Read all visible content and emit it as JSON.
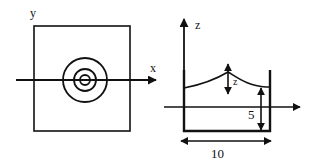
{
  "figure": {
    "background": "#ffffff",
    "ink": "#111111",
    "panels": [
      {
        "id": "top-view",
        "axis_labels": {
          "x": "x",
          "y": "y"
        },
        "shapes": [
          "square-boundary",
          "concentric-circles-3",
          "x-axis-arrow"
        ]
      },
      {
        "id": "side-view",
        "axis_labels": {
          "z": "z",
          "wave": "z"
        },
        "dimensions": {
          "width": "10",
          "depth": "5"
        },
        "shapes": [
          "container-walls",
          "free-surface-curve",
          "horizontal-axis-arrow",
          "depth-arrow",
          "width-arrow",
          "elevation-arrow"
        ]
      }
    ]
  }
}
